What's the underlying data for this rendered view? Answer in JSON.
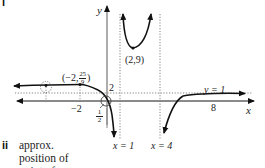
{
  "part_labels": {
    "part_i": "i",
    "part_ii": "ii"
  },
  "axes": {
    "x_label": "x",
    "y_label": "y"
  },
  "tick_labels": {
    "x_neg2": "−2",
    "x_8": "8",
    "y_2": "2",
    "y_half_num": "1",
    "y_half_den": "2"
  },
  "asymptotes": [
    {
      "label": "x = 1",
      "type": "vertical",
      "value": 1
    },
    {
      "label": "x = 4",
      "type": "vertical",
      "value": 4
    },
    {
      "label": "y = 1",
      "type": "horizontal",
      "value": 1
    }
  ],
  "points": [
    {
      "label": "(2,9)",
      "x": 2,
      "y": 9,
      "type": "local minimum"
    },
    {
      "label_main": "(−2,",
      "label_num": "25",
      "label_den": "9",
      "label_close": ")",
      "x": -2,
      "y": 2.78,
      "type": "point on curve"
    }
  ],
  "note": {
    "line1": "approx.",
    "line2": "position of",
    "line3": "point of"
  },
  "colors": {
    "curve": "#111111",
    "axis": "#8a8a8a",
    "asymptote": "#666666"
  }
}
